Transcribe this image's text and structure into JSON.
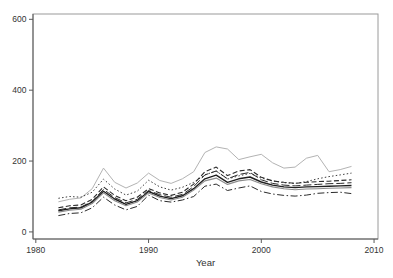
{
  "figure": {
    "background": "#ffffff",
    "frame_color": "#9a9a9a",
    "axis_color": "#5a5a5a",
    "label_color": "#333333"
  },
  "chart_data": {
    "type": "line",
    "title": "",
    "xlabel": "Year",
    "ylabel": "",
    "grid": false,
    "legend": "none",
    "xlim": [
      1979.75,
      2010.35
    ],
    "ylim": [
      -20,
      615
    ],
    "xticks": {
      "values": [
        1980,
        1990,
        2000,
        2010
      ],
      "labels": [
        "1980",
        "1990",
        "2000",
        "2010"
      ]
    },
    "yticks": {
      "values": [
        0,
        200,
        400,
        600
      ],
      "labels": [
        "0",
        "200",
        "400",
        "600"
      ]
    },
    "x": [
      1982,
      1983,
      1984,
      1985,
      1986,
      1987,
      1988,
      1989,
      1990,
      1991,
      1992,
      1993,
      1994,
      1995,
      1996,
      1997,
      1998,
      1999,
      2000,
      2001,
      2002,
      2003,
      2004,
      2005,
      2006,
      2007,
      2008
    ],
    "series": [
      {
        "name": "series-1-gray-solid",
        "stroke": "#b3b3b3",
        "dash": "",
        "width": 1.0,
        "values": [
          85,
          92,
          96,
          122,
          180,
          140,
          124,
          138,
          166,
          145,
          137,
          150,
          170,
          224,
          240,
          234,
          204,
          212,
          219,
          195,
          180,
          183,
          208,
          216,
          170,
          176,
          185
        ]
      },
      {
        "name": "series-2-dotted",
        "stroke": "#3c3c3c",
        "dash": "1.5,2.2",
        "width": 1.0,
        "values": [
          95,
          100,
          98,
          112,
          149,
          121,
          104,
          115,
          146,
          127,
          118,
          126,
          140,
          161,
          172,
          149,
          158,
          165,
          152,
          144,
          139,
          137,
          142,
          150,
          156,
          161,
          166
        ]
      },
      {
        "name": "series-3-dashed",
        "stroke": "#2b2b2b",
        "dash": "5,2.5",
        "width": 1.1,
        "values": [
          68,
          74,
          76,
          92,
          127,
          103,
          88,
          98,
          122,
          110,
          103,
          112,
          135,
          170,
          183,
          159,
          172,
          176,
          154,
          144,
          140,
          137,
          140,
          142,
          143,
          145,
          147
        ]
      },
      {
        "name": "series-4-longdash",
        "stroke": "#2b2b2b",
        "dash": "8,3",
        "width": 1.0,
        "values": [
          62,
          68,
          70,
          86,
          120,
          97,
          82,
          92,
          117,
          105,
          98,
          106,
          128,
          161,
          172,
          150,
          162,
          168,
          147,
          137,
          132,
          130,
          132,
          134,
          136,
          137,
          139
        ]
      },
      {
        "name": "series-5-solid-black",
        "stroke": "#1f1f1f",
        "dash": "",
        "width": 1.4,
        "values": [
          60,
          65,
          68,
          84,
          115,
          93,
          78,
          88,
          114,
          101,
          94,
          102,
          122,
          150,
          160,
          140,
          150,
          155,
          141,
          132,
          127,
          125,
          127,
          128,
          129,
          130,
          131
        ]
      },
      {
        "name": "series-6-gray-medium",
        "stroke": "#8c8c8c",
        "dash": "",
        "width": 1.1,
        "values": [
          56,
          61,
          64,
          80,
          110,
          88,
          74,
          84,
          110,
          97,
          90,
          98,
          118,
          144,
          152,
          134,
          144,
          148,
          136,
          127,
          122,
          119,
          121,
          122,
          123,
          124,
          125
        ]
      },
      {
        "name": "series-7-dashdot",
        "stroke": "#2b2b2b",
        "dash": "7,2.5,1.5,2.5",
        "width": 1.0,
        "values": [
          46,
          52,
          54,
          68,
          98,
          76,
          62,
          72,
          104,
          88,
          84,
          90,
          100,
          129,
          135,
          117,
          124,
          130,
          114,
          107,
          103,
          101,
          104,
          109,
          111,
          112,
          108
        ]
      }
    ],
    "plot_box_px": {
      "left": 33,
      "top": 14,
      "right": 378,
      "bottom": 239
    }
  }
}
